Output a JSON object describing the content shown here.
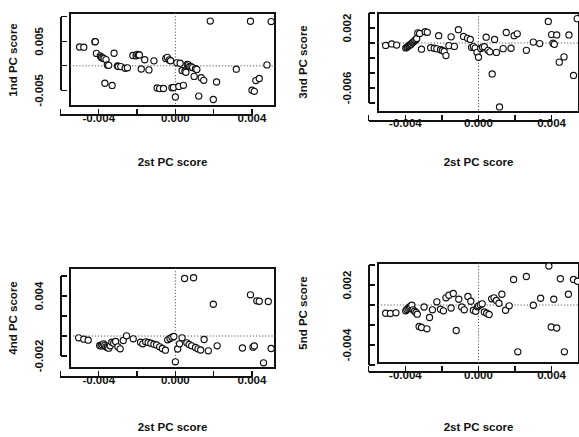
{
  "figure": {
    "title": "",
    "layout": "2x2 grid of scatterplots",
    "width": 579,
    "height": 437,
    "point_symbol": "open-circle",
    "colors": {
      "background": "#ffffff",
      "axis": "#111111",
      "point_stroke": "#111111",
      "point_fill": "#ffffff",
      "guide_line": "#5a5a5a"
    }
  },
  "chart_data": [
    {
      "id": "panel-top-left",
      "type": "scatter",
      "title": "",
      "xlabel": "2st PC score",
      "ylabel": "1nd PC score",
      "xticks": [
        -0.006,
        -0.004,
        -0.002,
        0.0,
        0.002,
        0.004
      ],
      "xtick_labels": [
        "",
        "-0.004",
        "",
        "0.000",
        "",
        "0.004"
      ],
      "yticks": [
        0.01,
        0.005,
        0.0,
        -0.005
      ],
      "ytick_labels": [
        "",
        "0.005",
        "",
        "-0.005"
      ],
      "xlim": [
        -0.0055,
        0.0052
      ],
      "ylim": [
        -0.0082,
        0.0108
      ],
      "grid": false,
      "guides": {
        "x": 0.0,
        "y": 0.0
      },
      "x": [
        -0.005,
        -0.00478,
        -0.0042,
        -0.00418,
        -0.00412,
        -0.00392,
        -0.00388,
        -0.00385,
        -0.00378,
        -0.00372,
        -0.00368,
        -0.00362,
        -0.00355,
        -0.00348,
        -0.0033,
        -0.0032,
        -0.00302,
        -0.00298,
        -0.00285,
        -0.00262,
        -0.0025,
        -0.00222,
        -0.00205,
        -0.002,
        -0.00192,
        -0.00188,
        -0.00178,
        -0.0016,
        -0.00138,
        -0.00112,
        -0.00095,
        -0.00082,
        -0.00062,
        -0.0005,
        -0.00042,
        -0.00032,
        -0.00025,
        -0.00018,
        -0.0001,
        0.0,
        8e-05,
        0.00018,
        0.00025,
        0.00035,
        0.00042,
        0.0005,
        0.00055,
        0.00062,
        0.00068,
        0.00075,
        0.00082,
        0.0009,
        0.00098,
        0.00105,
        0.00112,
        0.00122,
        0.00135,
        0.00148,
        0.00182,
        0.00198,
        0.00215,
        0.00318,
        0.00392,
        0.004,
        0.00412,
        0.0042,
        0.00438,
        0.00478,
        0.005
      ],
      "y": [
        0.00385,
        0.00382,
        0.00495,
        0.00492,
        0.00255,
        0.00205,
        0.00185,
        0.00168,
        0.00162,
        0.00148,
        -0.00355,
        0.00128,
        0.00018,
        0.0001,
        -0.004,
        0.00258,
        -2e-05,
        -0.00012,
        -0.00015,
        -0.00048,
        -0.0004,
        0.00212,
        0.00205,
        0.00235,
        0.00228,
        0.00222,
        -0.00065,
        0.00125,
        -0.00082,
        0.00102,
        -0.00452,
        -0.00465,
        -0.00462,
        0.00152,
        0.00175,
        0.00122,
        0.00105,
        -0.00448,
        -0.00442,
        -0.00635,
        0.00062,
        -0.0042,
        0.00055,
        -0.00095,
        -0.00398,
        -0.00108,
        -0.0013,
        0.00028,
        0.0002,
        -0.00012,
        -0.00018,
        -0.00035,
        -0.00215,
        -0.00058,
        -0.00072,
        -0.00618,
        -0.00242,
        -0.00295,
        0.00915,
        -0.00688,
        -0.0033,
        -0.00068,
        0.00912,
        -0.00498,
        -0.0052,
        -0.003,
        -0.00258,
        0.0002,
        0.00905
      ]
    },
    {
      "id": "panel-top-right",
      "type": "scatter",
      "title": "",
      "xlabel": "2st PC score",
      "ylabel": "3nd PC score",
      "xticks": [
        -0.006,
        -0.004,
        -0.002,
        0.0,
        0.002,
        0.004
      ],
      "xtick_labels": [
        "",
        "-0.004",
        "",
        "0.000",
        "",
        "0.004"
      ],
      "yticks": [
        0.004,
        0.002,
        0.0,
        -0.002,
        -0.004,
        -0.006,
        -0.008
      ],
      "ytick_labels": [
        "",
        "0.002",
        "",
        "",
        "",
        "-0.006",
        ""
      ],
      "xlim": [
        -0.0055,
        0.0055
      ],
      "ylim": [
        -0.0092,
        0.004
      ],
      "grid": false,
      "guides": {
        "x": 0.0,
        "y": 0.0
      },
      "x": [
        -0.00508,
        -0.00475,
        -0.00448,
        -0.00398,
        -0.00392,
        -0.00388,
        -0.00382,
        -0.00378,
        -0.00372,
        -0.00368,
        -0.00362,
        -0.00358,
        -0.00352,
        -0.00348,
        -0.00342,
        -0.00338,
        -0.00332,
        -0.00322,
        -0.00312,
        -0.00292,
        -0.0028,
        -0.00262,
        -0.00242,
        -0.00228,
        -0.00218,
        -0.00208,
        -0.00198,
        -0.00188,
        -0.00178,
        -0.00162,
        -0.0015,
        -0.00132,
        -0.0011,
        -0.00082,
        -0.0006,
        -0.00045,
        -0.00038,
        -0.00028,
        -0.00018,
        -8e-05,
        0.0,
        0.00012,
        0.00022,
        0.00032,
        0.00042,
        0.00052,
        0.00062,
        0.00075,
        0.00088,
        0.00098,
        0.00115,
        0.00135,
        0.00152,
        0.00178,
        0.00195,
        0.00212,
        0.00262,
        0.003,
        0.00335,
        0.00382,
        0.004,
        0.00408,
        0.00415,
        0.00428,
        0.00442,
        0.00468,
        0.00495,
        0.0052,
        0.0054
      ],
      "y": [
        -0.00032,
        -0.00012,
        -0.00028,
        -0.00065,
        -0.00058,
        -0.00048,
        -0.00038,
        -0.0003,
        -0.00022,
        -0.00012,
        2e-05,
        0.00012,
        0.00022,
        0.00035,
        0.00048,
        0.0006,
        0.00135,
        0.00128,
        -0.00082,
        0.0015,
        0.00142,
        -0.00062,
        -0.0007,
        -0.00078,
        0.00098,
        -0.0009,
        -0.001,
        -0.00112,
        -0.00168,
        -0.00035,
        0.00082,
        -0.00045,
        0.00178,
        0.00088,
        0.00062,
        0.00048,
        -0.00058,
        -0.00048,
        -0.00068,
        -0.00125,
        -0.0019,
        -0.00072,
        -0.00058,
        -0.0005,
        0.00078,
        -0.00098,
        -0.00118,
        -0.00412,
        0.00048,
        -0.00125,
        -0.00852,
        -0.00075,
        0.0014,
        -0.0007,
        0.00098,
        0.00122,
        -0.00098,
        0.00012,
        -8e-05,
        0.00288,
        0.00112,
        -2e-05,
        -0.00018,
        0.00108,
        -0.00255,
        -0.00185,
        0.00108,
        -0.00432,
        0.00325
      ]
    },
    {
      "id": "panel-bottom-left",
      "type": "scatter",
      "title": "",
      "xlabel": "2st PC score",
      "ylabel": "4nd PC score",
      "xticks": [
        -0.006,
        -0.004,
        -0.002,
        0.0,
        0.002,
        0.004
      ],
      "xtick_labels": [
        "",
        "-0.004",
        "",
        "0.000",
        "",
        "0.004"
      ],
      "yticks": [
        0.006,
        0.004,
        0.002,
        0.0,
        -0.002
      ],
      "ytick_labels": [
        "",
        "0.004",
        "",
        "",
        "-0.002"
      ],
      "xlim": [
        -0.0055,
        0.0052
      ],
      "ylim": [
        -0.0032,
        0.0068
      ],
      "grid": false,
      "guides": {
        "x": 0.0,
        "y": 0.0
      },
      "x": [
        -0.00505,
        -0.00478,
        -0.00455,
        -0.00395,
        -0.00388,
        -0.00382,
        -0.00375,
        -0.00368,
        -0.00362,
        -0.00355,
        -0.00348,
        -0.0034,
        -0.00332,
        -0.00322,
        -0.00312,
        -0.003,
        -0.00288,
        -0.00272,
        -0.00255,
        -0.0022,
        -0.00182,
        -0.0017,
        -0.00155,
        -0.00142,
        -0.00128,
        -0.00112,
        -0.00098,
        -0.00082,
        -0.00068,
        -0.00052,
        -0.0004,
        -0.00028,
        -0.00018,
        -8e-05,
        0.0,
        0.00012,
        0.00022,
        0.00035,
        0.00048,
        0.0006,
        0.00072,
        0.00085,
        0.00095,
        0.00105,
        0.00118,
        0.00132,
        0.0015,
        0.00172,
        0.00198,
        0.00218,
        0.0035,
        0.00392,
        0.00405,
        0.00412,
        0.00425,
        0.00438,
        0.0046,
        0.00485,
        0.005
      ],
      "y": [
        -0.00018,
        -0.00032,
        -0.00042,
        -0.00095,
        -0.001,
        -0.00088,
        -0.00078,
        -0.00092,
        -0.00108,
        -0.00115,
        -0.00122,
        -0.00098,
        -0.00062,
        -0.00072,
        -0.00055,
        -0.00108,
        -0.00128,
        -0.00045,
        2e-05,
        -0.00028,
        -0.00062,
        -0.00078,
        -0.00058,
        -0.00065,
        -0.00072,
        -0.00082,
        -0.0009,
        -0.00108,
        -0.00125,
        -0.00142,
        -0.00038,
        -0.00025,
        -0.00012,
        -5e-05,
        -0.00258,
        -0.0013,
        -0.00078,
        -0.00018,
        0.00575,
        -0.00068,
        -0.00085,
        -0.00098,
        0.00582,
        -0.00115,
        -0.00128,
        -0.0014,
        -0.00035,
        -0.00148,
        0.00318,
        -0.00098,
        -0.0012,
        0.00412,
        -0.00112,
        -0.001,
        0.00352,
        0.00348,
        -0.00268,
        0.00345,
        -0.00125
      ]
    },
    {
      "id": "panel-bottom-right",
      "type": "scatter",
      "title": "",
      "xlabel": "2st PC score",
      "ylabel": "5nd PC score",
      "xticks": [
        -0.006,
        -0.004,
        -0.002,
        0.0,
        0.002,
        0.004
      ],
      "xtick_labels": [
        "",
        "-0.004",
        "",
        "0.000",
        "",
        "0.004"
      ],
      "yticks": [
        0.004,
        0.002,
        0.0,
        -0.002,
        -0.004,
        -0.006
      ],
      "ytick_labels": [
        "",
        "0.002",
        "",
        "",
        "-0.004",
        ""
      ],
      "xlim": [
        -0.0055,
        0.0055
      ],
      "ylim": [
        -0.0058,
        0.0042
      ],
      "grid": false,
      "guides": {
        "x": 0.0,
        "y": 0.0
      },
      "x": [
        -0.00508,
        -0.00482,
        -0.00452,
        -0.00398,
        -0.00392,
        -0.00385,
        -0.00378,
        -0.00372,
        -0.00365,
        -0.00358,
        -0.0035,
        -0.00342,
        -0.00335,
        -0.00325,
        -0.00312,
        -0.00298,
        -0.00282,
        -0.00268,
        -0.00252,
        -0.00228,
        -0.00208,
        -0.00192,
        -0.00178,
        -0.00162,
        -0.0015,
        -0.00138,
        -0.00122,
        -0.00108,
        -0.00092,
        -0.00078,
        -0.00058,
        -0.00042,
        -0.00028,
        -0.00015,
        -5e-05,
        0.0,
        0.0001,
        0.0002,
        0.00032,
        0.00045,
        0.00058,
        0.00072,
        0.00085,
        0.00098,
        0.00112,
        0.00128,
        0.00148,
        0.00168,
        0.00192,
        0.00215,
        0.00262,
        0.003,
        0.0034,
        0.00385,
        0.00398,
        0.00412,
        0.00428,
        0.00448,
        0.0047,
        0.00492,
        0.0052,
        0.00542
      ],
      "y": [
        -0.00082,
        -0.00085,
        -0.00078,
        -0.00058,
        -0.00045,
        -0.00032,
        -0.00022,
        -0.00012,
        -2e-05,
        -0.00048,
        -0.00062,
        -0.00075,
        -0.00092,
        -0.00215,
        -0.00225,
        -0.0002,
        -0.00238,
        -0.00125,
        -0.00048,
        0.00032,
        -0.00042,
        -0.00058,
        0.00072,
        0.00098,
        -0.0003,
        0.00115,
        -0.00255,
        0.00058,
        -0.0002,
        -0.00048,
        0.00085,
        0.00038,
        -0.00052,
        -0.00062,
        -0.00018,
        -8e-05,
        2e-05,
        0.00012,
        -0.0007,
        -0.00082,
        -0.00095,
        0.00062,
        0.00072,
        0.00045,
        0.00018,
        0.00108,
        -0.00052,
        -8e-05,
        0.00255,
        -0.00468,
        0.00285,
        -2e-05,
        0.00068,
        0.0039,
        -0.0022,
        0.00058,
        -0.0023,
        0.00262,
        -0.00468,
        0.00108,
        0.00255,
        0.00238
      ]
    }
  ]
}
